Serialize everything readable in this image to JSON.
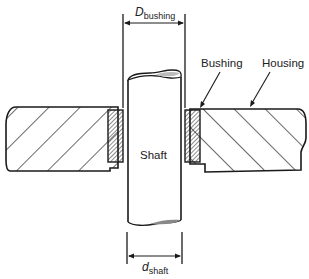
{
  "diagram": {
    "type": "cross-section",
    "labels": {
      "bushing_diameter": {
        "main": "D",
        "sub": "bushing"
      },
      "shaft_diameter": {
        "main": "d",
        "sub": "shaft"
      },
      "bushing": "Bushing",
      "housing": "Housing",
      "shaft": "Shaft"
    },
    "colors": {
      "line": "#1a1a1a",
      "background": "#ffffff"
    }
  }
}
